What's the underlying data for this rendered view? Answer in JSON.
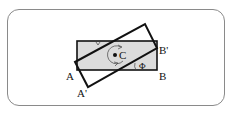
{
  "figure": {
    "colors": {
      "frame_border": "#8a8a8a",
      "original_fill": "#dcdcdc",
      "stroke": "#111111"
    },
    "labels": {
      "A": "A",
      "B": "B",
      "A_prime": "A'",
      "B_prime": "B'",
      "center": "C",
      "angle": "Φ"
    },
    "shapes": {
      "original_rect": {
        "x": 77,
        "y": 41,
        "width": 80,
        "height": 29,
        "filled": true
      },
      "rotated_rect_points": [
        [
          75,
          62
        ],
        [
          145,
          24
        ],
        [
          157,
          48
        ],
        [
          88,
          87
        ]
      ],
      "center_point": [
        116,
        55
      ]
    }
  }
}
